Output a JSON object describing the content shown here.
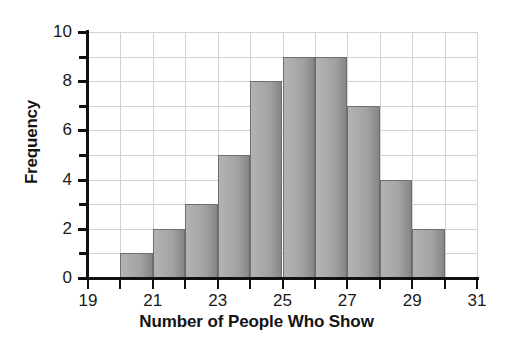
{
  "chart_data": {
    "type": "bar",
    "title": "",
    "subtitle": "",
    "xlabel": "Number of People Who Show",
    "ylabel": "Frequency",
    "xlim": [
      19,
      31
    ],
    "ylim": [
      0,
      10
    ],
    "grid": true,
    "legend": null,
    "bin_width": 1,
    "bin_edges": [
      20,
      21,
      22,
      23,
      24,
      25,
      26,
      27,
      28,
      29,
      30
    ],
    "categories": [
      "20-21",
      "21-22",
      "22-23",
      "23-24",
      "24-25",
      "25-26",
      "26-27",
      "27-28",
      "28-29",
      "29-30"
    ],
    "values": [
      1,
      2,
      3,
      5,
      8,
      9,
      9,
      7,
      4,
      2
    ],
    "x_tick_labels": [
      "19",
      "21",
      "23",
      "25",
      "27",
      "29",
      "31"
    ],
    "x_tick_values": [
      19,
      21,
      23,
      25,
      27,
      29,
      31
    ],
    "x_minor_ticks": [
      20,
      22,
      24,
      26,
      28,
      30
    ],
    "y_tick_labels": [
      "0",
      "2",
      "4",
      "6",
      "8",
      "10"
    ],
    "y_tick_values": [
      0,
      2,
      4,
      6,
      8,
      10
    ],
    "y_minor_ticks": [
      1,
      3,
      5,
      7,
      9
    ],
    "colors": {
      "bar_fill_light": "#b3b3b3",
      "bar_fill_dark": "#858585",
      "bar_border": "#6e6e6e",
      "gridline": "#d2d2d2",
      "axis": "#111111",
      "text": "#1a1a1a",
      "background": "#ffffff"
    }
  }
}
